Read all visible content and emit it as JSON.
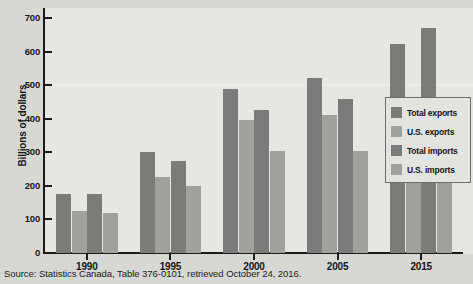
{
  "chart_data": {
    "type": "bar",
    "title": "",
    "xlabel": "",
    "ylabel": "Billions of dollars",
    "categories": [
      "1990",
      "1995",
      "2000",
      "2005",
      "2015"
    ],
    "ylim": [
      0,
      700
    ],
    "yticks": [
      0,
      100,
      200,
      300,
      400,
      500,
      600,
      700
    ],
    "ytick_labels": [
      "0",
      "100",
      "200",
      "300",
      "400",
      "500",
      "600",
      "700"
    ],
    "grid": false,
    "legend_position": "right",
    "series": [
      {
        "name": "Total exports",
        "color": "#7b7b7b",
        "values": [
          175,
          300,
          490,
          520,
          622
        ]
      },
      {
        "name": "U.S. exports",
        "color": "#a0a09d",
        "values": [
          125,
          225,
          395,
          410,
          450
        ]
      },
      {
        "name": "Total imports",
        "color": "#7b7b7b",
        "values": [
          175,
          275,
          425,
          460,
          670
        ]
      },
      {
        "name": "U.S. imports",
        "color": "#a0a09d",
        "values": [
          120,
          200,
          305,
          305,
          428
        ]
      }
    ],
    "source_note": "Source: Statistics Canada, Table 376-0101, retrieved October 24, 2016."
  },
  "colors": {
    "figure_background": "#d7d7d4",
    "plot_background": "#e6e6e3",
    "axis": "#1b1b1b",
    "series_dark": "#7b7b7b",
    "series_light": "#a0a09d",
    "legend_background": "#e3e3e0",
    "legend_border": "#6d6d6d"
  }
}
